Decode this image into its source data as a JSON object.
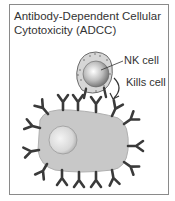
{
  "figure": {
    "title_line1": "Antibody-Dependent Cellular",
    "title_line2": "Cytotoxicity (ADCC)",
    "labels": {
      "nk_cell": "NK cell",
      "kills_cell": "Kills cell"
    },
    "colors": {
      "border": "#8a8a8a",
      "antibody": "#3a3a3a",
      "target_cell": "#c8c8c8",
      "nk_cytoplasm": "#d6d6d6",
      "text": "#333333"
    }
  }
}
